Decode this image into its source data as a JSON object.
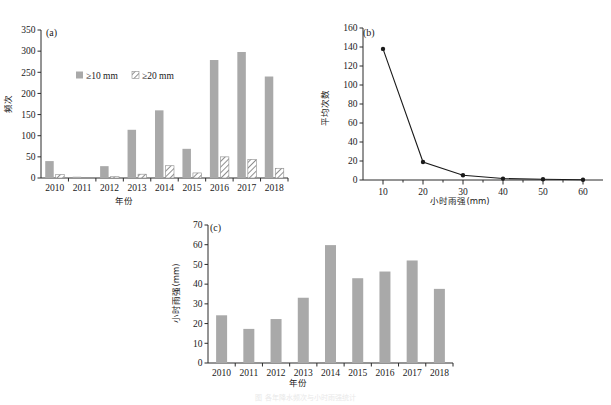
{
  "figure": {
    "background": "#ffffff",
    "bar_color": "#a9a9a9",
    "line_color": "#1a1a1a",
    "axis_color": "#2b2b2b"
  },
  "panel_a": {
    "tag": "(a)",
    "legend": [
      {
        "label": "≥10 mm",
        "style": "solid"
      },
      {
        "label": "≥20 mm",
        "style": "hatched"
      }
    ],
    "chart_data": {
      "type": "bar",
      "title": "",
      "xlabel": "年份",
      "ylabel": "频次",
      "ylim": [
        0,
        350
      ],
      "yticks": [
        0,
        50,
        100,
        150,
        200,
        250,
        300,
        350
      ],
      "grid": false,
      "legend_position": "upper-left-inside",
      "categories": [
        "2010",
        "2011",
        "2012",
        "2013",
        "2014",
        "2015",
        "2016",
        "2017",
        "2018"
      ],
      "series": [
        {
          "name": "≥10 mm",
          "values": [
            40,
            3,
            28,
            114,
            160,
            69,
            279,
            298,
            240
          ]
        },
        {
          "name": "≥20 mm",
          "values": [
            8,
            0,
            3,
            9,
            29,
            12,
            50,
            44,
            23
          ]
        }
      ]
    }
  },
  "panel_b": {
    "tag": "(b)",
    "chart_data": {
      "type": "line",
      "title": "",
      "xlabel": "小时雨强(mm)",
      "ylabel": "平均次数",
      "ylim": [
        0,
        160
      ],
      "yticks": [
        0,
        20,
        40,
        60,
        80,
        100,
        120,
        140,
        160
      ],
      "xlim": [
        5,
        65
      ],
      "xticks": [
        10,
        20,
        30,
        40,
        50,
        60
      ],
      "grid": false,
      "x": [
        10,
        20,
        30,
        40,
        50,
        60
      ],
      "values": [
        138,
        19,
        5,
        1.5,
        0.8,
        0.3
      ],
      "marker": "filled-circle"
    }
  },
  "panel_c": {
    "tag": "(c)",
    "chart_data": {
      "type": "bar",
      "title": "",
      "xlabel": "年份",
      "ylabel": "小时雨强(mm)",
      "ylim": [
        0,
        70
      ],
      "yticks": [
        0,
        10,
        20,
        30,
        40,
        50,
        60,
        70
      ],
      "grid": false,
      "categories": [
        "2010",
        "2011",
        "2012",
        "2013",
        "2014",
        "2015",
        "2016",
        "2017",
        "2018"
      ],
      "values": [
        24.2,
        17.3,
        22.3,
        33.1,
        59.8,
        43.0,
        46.4,
        52.0,
        37.6
      ]
    }
  },
  "caption": {
    "text": "图  各年降水频次与小时雨强统计"
  }
}
